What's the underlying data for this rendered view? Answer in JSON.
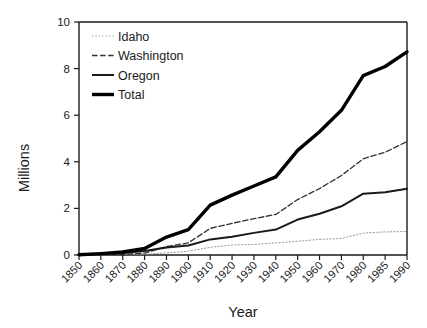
{
  "chart_data": {
    "type": "line",
    "title": "",
    "xlabel": "Year",
    "ylabel": "Millions",
    "ylim": [
      0,
      10
    ],
    "yticks": [
      0,
      2,
      4,
      6,
      8,
      10
    ],
    "grid": false,
    "legend_position": "top-left",
    "categories": [
      "1850",
      "1860",
      "1870",
      "1880",
      "1890",
      "1900",
      "1910",
      "1920",
      "1930",
      "1940",
      "1950",
      "1960",
      "1970",
      "1980",
      "1985",
      "1990"
    ],
    "series": [
      {
        "name": "Idaho",
        "style": "dotted",
        "color": "#999999",
        "width": 1.0,
        "values": [
          0.0,
          0.0,
          0.02,
          0.03,
          0.09,
          0.16,
          0.33,
          0.43,
          0.45,
          0.52,
          0.59,
          0.67,
          0.71,
          0.94,
          0.99,
          1.01
        ]
      },
      {
        "name": "Washington",
        "style": "dashed",
        "color": "#333333",
        "width": 1.3,
        "values": [
          0.0,
          0.01,
          0.02,
          0.08,
          0.36,
          0.52,
          1.14,
          1.36,
          1.56,
          1.74,
          2.38,
          2.85,
          3.41,
          4.13,
          4.41,
          4.87
        ]
      },
      {
        "name": "Oregon",
        "style": "solid",
        "color": "#1a1a1a",
        "width": 2.0,
        "values": [
          0.01,
          0.05,
          0.09,
          0.17,
          0.32,
          0.41,
          0.67,
          0.78,
          0.95,
          1.09,
          1.52,
          1.77,
          2.09,
          2.63,
          2.69,
          2.84
        ]
      },
      {
        "name": "Total",
        "style": "solid",
        "color": "#000000",
        "width": 3.4,
        "values": [
          0.01,
          0.06,
          0.13,
          0.28,
          0.77,
          1.09,
          2.14,
          2.57,
          2.96,
          3.35,
          4.49,
          5.29,
          6.21,
          7.7,
          8.09,
          8.72
        ]
      }
    ]
  },
  "legend": {
    "items": [
      {
        "label": "Idaho"
      },
      {
        "label": "Washington"
      },
      {
        "label": "Oregon"
      },
      {
        "label": "Total"
      }
    ]
  },
  "axes": {
    "y_title": "Millions",
    "x_title": "Year"
  }
}
